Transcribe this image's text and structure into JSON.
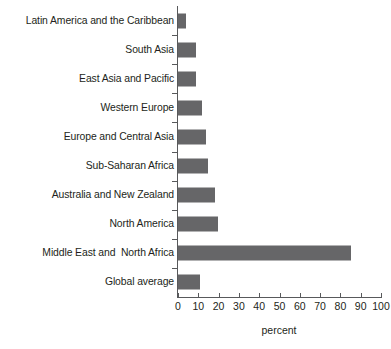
{
  "chart_data": {
    "type": "bar",
    "orientation": "horizontal",
    "title": "",
    "xlabel": "percent",
    "ylabel": "",
    "xlim": [
      0,
      100
    ],
    "xticks": [
      0,
      10,
      20,
      30,
      40,
      50,
      60,
      70,
      80,
      90,
      100
    ],
    "grid": false,
    "legend": null,
    "bar_color": "#666668",
    "axis_color": "#58595b",
    "categories": [
      "Latin America and the Caribbean",
      "South Asia",
      "East Asia and Pacific",
      "Western Europe",
      "Europe and Central Asia",
      "Sub-Saharan Africa",
      "Australia and New Zealand",
      "North America",
      "Middle East and  North Africa",
      "Global average"
    ],
    "values": [
      4,
      9,
      9,
      12,
      14,
      15,
      18,
      19.5,
      85,
      11
    ]
  }
}
